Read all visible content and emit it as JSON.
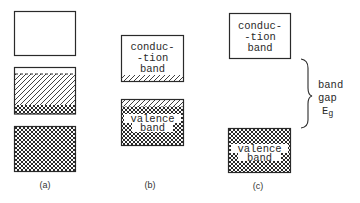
{
  "figure": {
    "panels": [
      {
        "id": "a",
        "caption": "(a)",
        "bands": [
          {
            "name": "empty-band",
            "fill": "empty"
          },
          {
            "name": "partial-band",
            "fill": "diagonal-over-cross"
          },
          {
            "name": "filled-band",
            "fill": "cross-hatch"
          }
        ]
      },
      {
        "id": "b",
        "caption": "(b)",
        "bands": [
          {
            "name": "conduction-band",
            "label_lines": [
              "conduc-",
              "-tion",
              "band"
            ],
            "fill": "empty-with-hatched-bottom"
          },
          {
            "name": "valence-band",
            "label_lines": [
              "valence",
              "band"
            ],
            "fill": "cross-hatch-with-hatched-top"
          }
        ]
      },
      {
        "id": "c",
        "caption": "(c)",
        "bands": [
          {
            "name": "conduction-band",
            "label_lines": [
              "conduc-",
              "-tion",
              "band"
            ],
            "fill": "empty"
          },
          {
            "name": "valence-band",
            "label_lines": [
              "valence",
              "band"
            ],
            "fill": "cross-hatch"
          }
        ],
        "gap": {
          "label_lines": [
            "band",
            "gap",
            "E"
          ],
          "subscript": "g"
        }
      }
    ]
  },
  "colors": {
    "stroke": "#2a2a2a",
    "background": "#ffffff"
  }
}
